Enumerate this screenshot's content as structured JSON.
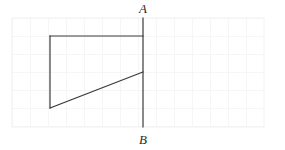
{
  "figure": {
    "name": "geometry-quadrilateral-on-grid",
    "canvas": {
      "width": 285,
      "height": 150,
      "background": "#ffffff"
    },
    "grid": {
      "x": 12,
      "y": 18,
      "width": 252,
      "height": 109,
      "cell_size": 18,
      "line_color": "#eeeef1",
      "border_color": "#f2f2f4",
      "columns": 14,
      "rows": 6
    },
    "stroke_color": "#3a3a3a",
    "stroke_width": 1.2,
    "labels": [
      {
        "id": "A",
        "text": "A",
        "x": 143,
        "y": 13,
        "anchor": "middle"
      },
      {
        "id": "B",
        "text": "B",
        "x": 143,
        "y": 144,
        "anchor": "middle"
      }
    ],
    "points": {
      "A": {
        "x": 143,
        "y": 18
      },
      "B": {
        "x": 143,
        "y": 127
      },
      "top_left": {
        "x": 50,
        "y": 36
      },
      "top_right": {
        "x": 143,
        "y": 36
      },
      "bottom_left": {
        "x": 50,
        "y": 108
      },
      "diag_right": {
        "x": 143,
        "y": 72
      }
    },
    "segments": [
      {
        "id": "line-AB",
        "x1": 143,
        "y1": 18,
        "x2": 143,
        "y2": 127
      },
      {
        "id": "line-top",
        "x1": 50,
        "y1": 36,
        "x2": 143,
        "y2": 36
      },
      {
        "id": "line-left",
        "x1": 50,
        "y1": 36,
        "x2": 50,
        "y2": 108
      },
      {
        "id": "line-diagonal",
        "x1": 50,
        "y1": 108,
        "x2": 143,
        "y2": 72
      }
    ]
  }
}
